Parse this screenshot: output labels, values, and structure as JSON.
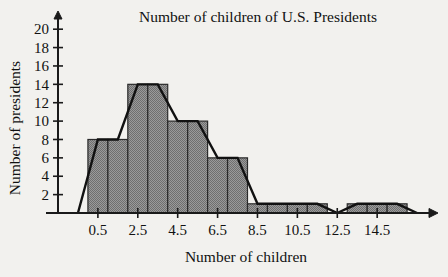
{
  "chart_data": {
    "type": "bar",
    "title": "Number of children of U.S. Presidents",
    "xlabel": "Number of children",
    "ylabel": "Number of presidents",
    "categories": [
      "0.5",
      "1.5",
      "2.5",
      "3.5",
      "4.5",
      "5.5",
      "6.5",
      "7.5",
      "8.5",
      "9.5",
      "10.5",
      "11.5",
      "12.5",
      "13.5",
      "14.5",
      "15.5"
    ],
    "values": [
      8,
      8,
      14,
      14,
      10,
      10,
      6,
      6,
      1,
      1,
      1,
      1,
      0,
      1,
      1,
      1
    ],
    "xtick_labels": [
      "0.5",
      "2.5",
      "4.5",
      "6.5",
      "8.5",
      "10.5",
      "12.5",
      "14.5"
    ],
    "xtick_values": [
      0.5,
      2.5,
      4.5,
      6.5,
      8.5,
      10.5,
      12.5,
      14.5
    ],
    "ytick_labels": [
      "2",
      "4",
      "6",
      "8",
      "10",
      "12",
      "14",
      "16",
      "18",
      "20"
    ],
    "ytick_values": [
      2,
      4,
      6,
      8,
      10,
      12,
      14,
      16,
      18,
      20
    ],
    "ylim": [
      0,
      21
    ],
    "xlim": [
      -1.5,
      17.5
    ],
    "grid": false,
    "legend": "none",
    "bar_fill_color": "#8a8a8a",
    "bar_edge_color": "#2a2a2a",
    "polygon_color": "#111111",
    "background_color": "#f2f1ee",
    "overlay": {
      "type": "frequency-polygon",
      "x": [
        -0.5,
        0.5,
        1.5,
        2.5,
        3.5,
        4.5,
        5.5,
        6.5,
        7.5,
        8.5,
        9.5,
        10.5,
        11.5,
        12.5,
        13.5,
        14.5,
        15.5,
        16.5
      ],
      "y": [
        0,
        8,
        8,
        14,
        14,
        10,
        10,
        6,
        6,
        1,
        1,
        1,
        1,
        0,
        1,
        1,
        1,
        0
      ]
    }
  },
  "axes": {
    "y_axis_name": "y-axis-presidents",
    "x_axis_name": "x-axis-children"
  }
}
